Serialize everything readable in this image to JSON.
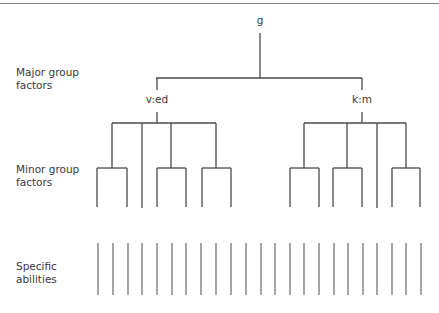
{
  "diagram": {
    "type": "hierarchical-tree",
    "root": {
      "label": "g"
    },
    "levels": [
      {
        "label_line1": "Major group",
        "label_line2": "factors"
      },
      {
        "label_line1": "Minor group",
        "label_line2": "factors"
      },
      {
        "label_line1": "Specific",
        "label_line2": "abilities"
      }
    ],
    "major_factors": [
      {
        "label": "v:ed",
        "children": [
          "minor-group",
          "single-line",
          "minor-group",
          "minor-group"
        ]
      },
      {
        "label": "k:m",
        "children": [
          "minor-group",
          "minor-group",
          "single-line",
          "minor-group"
        ]
      }
    ],
    "specific_abilities_count": 23,
    "colors": {
      "line": "#4a4a4a",
      "text": "#3a3a3a",
      "top_rule": "#8a8a8a"
    }
  }
}
